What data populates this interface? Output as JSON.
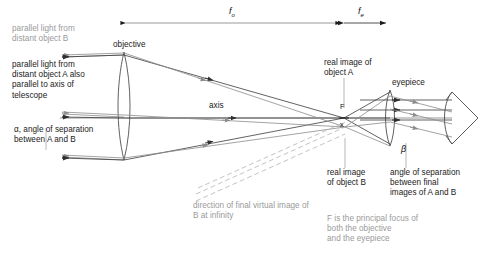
{
  "figure": {
    "background": "#ffffff"
  },
  "colors": {
    "ray_a": "#3a3a3a",
    "ray_b": "#8c8c8c",
    "lens_outline": "#4a4a4a",
    "axis": "#555555",
    "dimension": "#222222",
    "text_dark": "#1a1a1a",
    "text_grey": "#9a9a9a",
    "text_mid": "#5d5d5d",
    "virtual_ray": "#b5b5b5"
  },
  "dimensions": {
    "f_objective": "f",
    "f_objective_sub": "o",
    "f_eyepiece": "f",
    "f_eyepiece_sub": "e"
  },
  "labels": {
    "parallel_light_b": "parallel light from\ndistant object B",
    "objective": "objective",
    "parallel_light_a": "parallel light from\ndistant object A also\nparallel to axis of\ntelescope",
    "axis": "axis",
    "alpha_note": "α, angle of separation\nbetween A and B",
    "real_image_a": "real image of\nobject A",
    "eyepiece": "eyepiece",
    "focus_point": "F",
    "image_point": "x",
    "beta_symbol": "β",
    "real_image_b": "real image\nof object B",
    "angle_separation_final": "angle of separation\nbetween final\nimages of A and B",
    "virtual_image_direction": "direction of final virtual image of\nB at infinity",
    "principal_focus_note": "F is the principal focus of\nboth the objective\nand the eyepiece"
  },
  "elements": {
    "objective_lens_name": "objective-lens",
    "eyepiece_lens_name": "eyepiece-lens",
    "eye_name": "observer-eye",
    "optical_axis_name": "optical-axis"
  },
  "geometry": {
    "objective_x": 124,
    "objective_top_y": 52,
    "objective_bottom_y": 160,
    "eyepiece_x": 390,
    "eyepiece_top_y": 90,
    "eyepiece_bottom_y": 146,
    "focus_x": 344,
    "axis_y": 118,
    "eye_x": 452,
    "f_objective_span": [
      126,
      341
    ],
    "f_eyepiece_span": [
      344,
      386
    ]
  }
}
